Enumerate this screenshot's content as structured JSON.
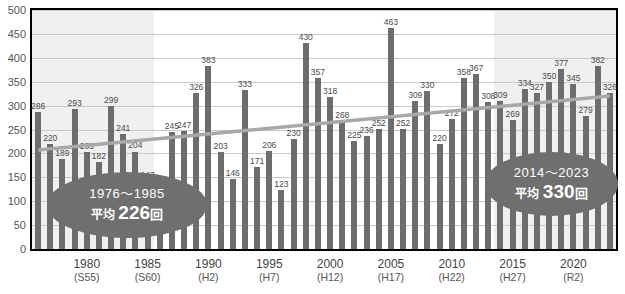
{
  "chart_data": {
    "type": "bar",
    "title": "",
    "xlabel": "",
    "ylabel": "",
    "ylim": [
      0,
      500
    ],
    "ytick_step": 50,
    "yticks": [
      "500",
      "450",
      "400",
      "350",
      "300",
      "250",
      "200",
      "150",
      "100",
      "50",
      "0"
    ],
    "grid": true,
    "legend": "none",
    "categories": [
      1976,
      1977,
      1978,
      1979,
      1980,
      1981,
      1982,
      1983,
      1984,
      1985,
      1986,
      1987,
      1988,
      1989,
      1990,
      1991,
      1992,
      1993,
      1994,
      1995,
      1996,
      1997,
      1998,
      1999,
      2000,
      2001,
      2002,
      2003,
      2004,
      2005,
      2006,
      2007,
      2008,
      2009,
      2010,
      2011,
      2012,
      2013,
      2014,
      2015,
      2016,
      2017,
      2018,
      2019,
      2020,
      2021,
      2022,
      2023
    ],
    "values": [
      286,
      220,
      189,
      293,
      203,
      182,
      299,
      241,
      204,
      143,
      134,
      245,
      247,
      326,
      383,
      203,
      146,
      333,
      171,
      206,
      123,
      230,
      430,
      357,
      318,
      268,
      225,
      236,
      252,
      463,
      252,
      309,
      330,
      220,
      272,
      358,
      367,
      308,
      309,
      269,
      334,
      327,
      350,
      377,
      345,
      279,
      382,
      326
    ],
    "bar_color": "#6d6d6d",
    "trendline": {
      "type": "linear",
      "start_value": 207,
      "end_value": 320,
      "color": "#a8a8a8"
    },
    "xtick_labels": [
      {
        "year": "1980",
        "era": "(S55)"
      },
      {
        "year": "1985",
        "era": "(S60)"
      },
      {
        "year": "1990",
        "era": "(H2)"
      },
      {
        "year": "1995",
        "era": "(H7)"
      },
      {
        "year": "2000",
        "era": "(H12)"
      },
      {
        "year": "2005",
        "era": "(H17)"
      },
      {
        "year": "2010",
        "era": "(H22)"
      },
      {
        "year": "2015",
        "era": "(H27)"
      },
      {
        "year": "2020",
        "era": "(R2)"
      }
    ],
    "shaded_bands": [
      {
        "from": 1976,
        "to": 1985
      },
      {
        "from": 2014,
        "to": 2023
      }
    ],
    "annotations": [
      {
        "range": "1976〜2985",
        "avg_prefix": "平均",
        "avg_value": "226",
        "avg_unit": "回"
      },
      {
        "range": "2014〜2023",
        "avg_prefix": "平均",
        "avg_value": "330",
        "avg_unit": "回"
      }
    ]
  },
  "callouts": {
    "left": {
      "range": "1976〜1985",
      "prefix": "平均",
      "value": "226",
      "unit": "回"
    },
    "right": {
      "range": "2014〜2023",
      "prefix": "平均",
      "value": "330",
      "unit": "回"
    }
  }
}
